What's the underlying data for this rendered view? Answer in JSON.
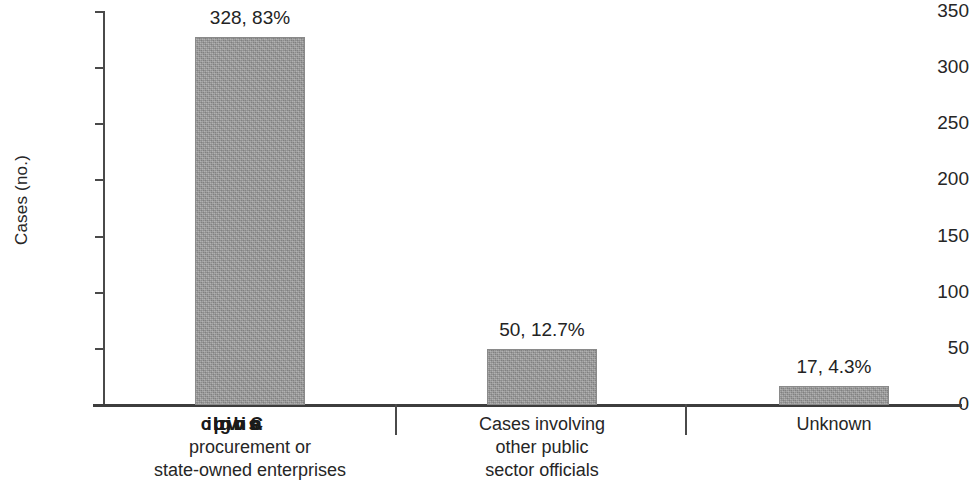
{
  "chart_data": {
    "type": "bar",
    "title": "",
    "xlabel": "",
    "ylabel": "Cases (no.)",
    "ylim": [
      0,
      350
    ],
    "yticks": [
      0,
      50,
      100,
      150,
      200,
      250,
      300,
      350
    ],
    "ytick_labels": [
      "0",
      "50",
      "100",
      "150",
      "200",
      "250",
      "300",
      "350"
    ],
    "grid": false,
    "legend": "none",
    "categories": [
      "Cases involving public procurement or state-owned enterprises",
      "Cases involving other public sector officials",
      "Unknown"
    ],
    "category_label_lines": [
      [
        "Cases involving public",
        "procurement or",
        "state-owned enterprises"
      ],
      [
        "Cases involving",
        "other public",
        "sector officials"
      ],
      [
        "Unknown"
      ]
    ],
    "values": [
      328,
      50,
      17
    ],
    "percentages": [
      "83%",
      "12.7%",
      "4.3%"
    ],
    "data_labels": [
      "328, 83%",
      "50, 12.7%",
      "17, 4.3%"
    ],
    "bar_color": "#9b9b9b",
    "axis_color": "#3d3d3d",
    "text_color": "#262626"
  },
  "axis": {
    "y_title": "Cases (no.)",
    "ticks": [
      {
        "label": "350",
        "value": 350
      },
      {
        "label": "300",
        "value": 300
      },
      {
        "label": "250",
        "value": 250
      },
      {
        "label": "200",
        "value": 200
      },
      {
        "label": "150",
        "value": 150
      },
      {
        "label": "100",
        "value": 100
      },
      {
        "label": "50",
        "value": 50
      },
      {
        "label": "0",
        "value": 0
      }
    ]
  },
  "bars": [
    {
      "name": "public-procurement",
      "data_label": "328, 83%",
      "lines": [
        "Cases involving public",
        "procurement or",
        "state-owned enterprises"
      ],
      "first_line_is_overprint": true
    },
    {
      "name": "other-public-sector",
      "data_label": "50, 12.7%",
      "lines": [
        "Cases involving",
        "other public",
        "sector officials"
      ],
      "first_line_is_overprint": false
    },
    {
      "name": "unknown",
      "data_label": "17, 4.3%",
      "lines": [
        "Unknown"
      ],
      "first_line_is_overprint": false
    }
  ]
}
